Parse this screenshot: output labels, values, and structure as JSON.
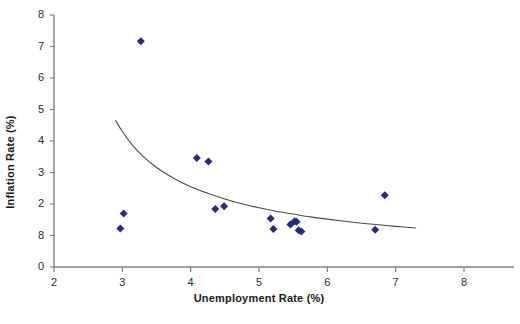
{
  "chart_data": {
    "type": "scatter",
    "title": "",
    "xlabel": "Unemployment Rate (%)",
    "ylabel": "Inflation Rate (%)",
    "xlim": [
      2,
      8
    ],
    "ylim": [
      0,
      8
    ],
    "xticks": [
      2,
      3,
      4,
      5,
      6,
      7,
      8
    ],
    "xtick_labels": [
      "2",
      "3",
      "4",
      "5",
      "6",
      "7",
      "8"
    ],
    "yticks": [
      0,
      1,
      2,
      3,
      4,
      5,
      6,
      7,
      8
    ],
    "ytick_labels": [
      "0",
      "8",
      "2",
      "3",
      "4",
      "5",
      "6",
      "7",
      "8"
    ],
    "grid": false,
    "legend": false,
    "marker": "diamond",
    "marker_color": "#2a2a7a",
    "series": [
      {
        "name": "Unemployment vs Inflation",
        "points": [
          {
            "x": 2.97,
            "y": 1.22
          },
          {
            "x": 3.02,
            "y": 1.7
          },
          {
            "x": 3.27,
            "y": 7.17
          },
          {
            "x": 4.09,
            "y": 3.46
          },
          {
            "x": 4.26,
            "y": 3.35
          },
          {
            "x": 4.36,
            "y": 1.84
          },
          {
            "x": 4.49,
            "y": 1.93
          },
          {
            "x": 5.17,
            "y": 1.54
          },
          {
            "x": 5.21,
            "y": 1.21
          },
          {
            "x": 5.46,
            "y": 1.35
          },
          {
            "x": 5.52,
            "y": 1.45
          },
          {
            "x": 5.55,
            "y": 1.44
          },
          {
            "x": 5.58,
            "y": 1.17
          },
          {
            "x": 5.62,
            "y": 1.13
          },
          {
            "x": 6.7,
            "y": 1.18
          },
          {
            "x": 6.84,
            "y": 2.28
          }
        ]
      }
    ],
    "trendline": {
      "name": "fitted Phillips curve",
      "style": "solid",
      "color": "#4a4a4a",
      "x_start": 2.9,
      "x_end": 7.3,
      "points": [
        {
          "x": 2.9,
          "y": 4.66
        },
        {
          "x": 3.0,
          "y": 4.3
        },
        {
          "x": 3.15,
          "y": 3.86
        },
        {
          "x": 3.3,
          "y": 3.52
        },
        {
          "x": 3.5,
          "y": 3.16
        },
        {
          "x": 3.75,
          "y": 2.82
        },
        {
          "x": 4.0,
          "y": 2.55
        },
        {
          "x": 4.25,
          "y": 2.34
        },
        {
          "x": 4.5,
          "y": 2.16
        },
        {
          "x": 4.75,
          "y": 2.01
        },
        {
          "x": 5.0,
          "y": 1.88
        },
        {
          "x": 5.25,
          "y": 1.77
        },
        {
          "x": 5.5,
          "y": 1.68
        },
        {
          "x": 5.75,
          "y": 1.59
        },
        {
          "x": 6.0,
          "y": 1.52
        },
        {
          "x": 6.25,
          "y": 1.45
        },
        {
          "x": 6.5,
          "y": 1.39
        },
        {
          "x": 6.75,
          "y": 1.34
        },
        {
          "x": 7.0,
          "y": 1.29
        },
        {
          "x": 7.3,
          "y": 1.24
        }
      ]
    }
  },
  "axes": {
    "x_axis_name": "unemployment-rate-axis",
    "y_axis_name": "inflation-rate-axis"
  }
}
